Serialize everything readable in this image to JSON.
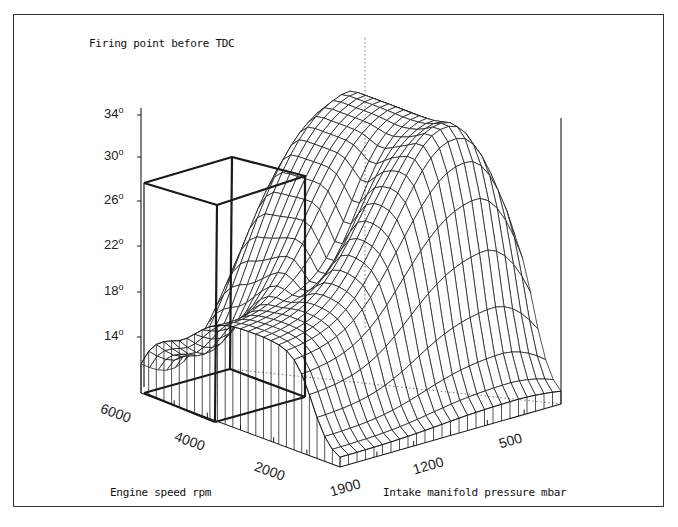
{
  "chart_data": {
    "type": "surface3d",
    "title": "Firing point before TDC",
    "zlabel": "Firing point before TDC",
    "xlabel": "Engine speed rpm",
    "ylabel": "Intake manifold pressure mbar",
    "z_ticks": [
      {
        "value": 34,
        "label": "34",
        "y": 115
      },
      {
        "value": 30,
        "label": "30",
        "y": 157
      },
      {
        "value": 26,
        "label": "26",
        "y": 201
      },
      {
        "value": 22,
        "label": "22",
        "y": 246
      },
      {
        "value": 18,
        "label": "18",
        "y": 292
      },
      {
        "value": 14,
        "label": "14",
        "y": 337
      }
    ],
    "z_unit": "o",
    "speed_ticks": [
      "6000",
      "4000",
      "2000"
    ],
    "speed_tick_positions": [
      {
        "x": 104,
        "y": 408
      },
      {
        "x": 178,
        "y": 436
      },
      {
        "x": 258,
        "y": 466
      }
    ],
    "pressure_ticks": [
      "1900",
      "1200",
      "500"
    ],
    "pressure_tick_positions": [
      {
        "x": 328,
        "y": 480
      },
      {
        "x": 411,
        "y": 458
      },
      {
        "x": 497,
        "y": 432
      }
    ],
    "zlim": [
      10,
      36
    ],
    "grid": false,
    "highlight_box": {
      "description": "bold wireframe box marking an operating region at high engine speed"
    },
    "surface_description": "Ignition timing map: high plateau (~34°) at low pressure / mid speed, falling steeply toward high pressure and low speed; dip toward ~12° at low speed high pressure"
  },
  "labels": {
    "title": "Firing point before TDC",
    "x_axis": "Engine speed rpm",
    "y_axis": "Intake manifold pressure mbar"
  },
  "colors": {
    "line": "#1a1a1a",
    "background": "#ffffff",
    "frame": "#333333"
  }
}
